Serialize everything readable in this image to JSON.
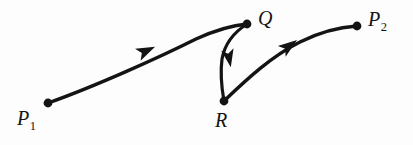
{
  "figure": {
    "kind": "directed-curve-diagram",
    "background_color": "#fdfdfd",
    "ink_color": "#141414",
    "width": 413,
    "height": 145,
    "points": [
      {
        "id": "p1",
        "label": "P",
        "subscript": "1",
        "x": 48,
        "y": 103
      },
      {
        "id": "q",
        "label": "Q",
        "subscript": "",
        "x": 247,
        "y": 24
      },
      {
        "id": "r",
        "label": "R",
        "subscript": "",
        "x": 224,
        "y": 101
      },
      {
        "id": "p2",
        "label": "P",
        "subscript": "2",
        "x": 357,
        "y": 26
      }
    ],
    "curves": [
      {
        "id": "p1-to-q",
        "from": "p1",
        "to": "q",
        "arrow_direction": "up-right",
        "path": "M 48 103 C 96 86, 160 57, 196 39 C 218 29, 236 25, 247 24",
        "arrow_at_x": 146,
        "arrow_at_y": 51,
        "arrow_angle_deg": -25
      },
      {
        "id": "q-to-r",
        "from": "q",
        "to": "r",
        "arrow_direction": "down",
        "path": "M 247 24 C 236 31, 225 42, 222 59 C 220 74, 222 90, 224 101",
        "arrow_at_x": 229,
        "arrow_at_y": 58,
        "arrow_angle_deg": 79
      },
      {
        "id": "r-to-p2",
        "from": "r",
        "to": "p2",
        "arrow_direction": "up-right",
        "path": "M 224 101 C 248 78, 272 56, 300 42 C 322 31, 342 27, 357 26",
        "arrow_at_x": 289,
        "arrow_at_y": 46,
        "arrow_angle_deg": -36
      }
    ]
  }
}
